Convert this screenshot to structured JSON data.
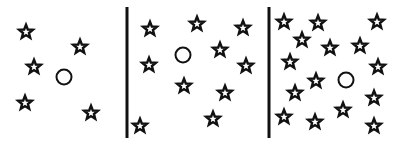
{
  "diagram": {
    "width": 401,
    "height": 145,
    "background": "#ffffff",
    "ink": "#111111",
    "dividers": [
      {
        "x": 127,
        "y1": 7,
        "y2": 138
      },
      {
        "x": 269,
        "y1": 7,
        "y2": 138
      }
    ],
    "panels": [
      {
        "name": "panel-1",
        "star_count": 5,
        "circle": {
          "cx": 64,
          "cy": 77,
          "r": 7.5
        },
        "stars": [
          [
            26,
            32
          ],
          [
            80,
            47
          ],
          [
            34,
            67
          ],
          [
            25,
            103
          ],
          [
            91,
            113
          ]
        ]
      },
      {
        "name": "panel-2",
        "star_count": 9,
        "circle": {
          "cx": 183,
          "cy": 55,
          "r": 7.5
        },
        "stars": [
          [
            150,
            29
          ],
          [
            197,
            24
          ],
          [
            243,
            28
          ],
          [
            220,
            50
          ],
          [
            149,
            65
          ],
          [
            246,
            66
          ],
          [
            184,
            86
          ],
          [
            225,
            93
          ],
          [
            213,
            119
          ],
          [
            140,
            126
          ]
        ]
      },
      {
        "name": "panel-3",
        "star_count": 18,
        "circle": {
          "cx": 346,
          "cy": 80,
          "r": 7.5
        },
        "stars": [
          [
            284,
            22
          ],
          [
            318,
            23
          ],
          [
            377,
            22
          ],
          [
            302,
            40
          ],
          [
            330,
            48
          ],
          [
            360,
            46
          ],
          [
            290,
            62
          ],
          [
            378,
            67
          ],
          [
            316,
            81
          ],
          [
            295,
            93
          ],
          [
            374,
            98
          ],
          [
            343,
            110
          ],
          [
            284,
            117
          ],
          [
            315,
            122
          ],
          [
            374,
            126
          ]
        ]
      }
    ]
  }
}
